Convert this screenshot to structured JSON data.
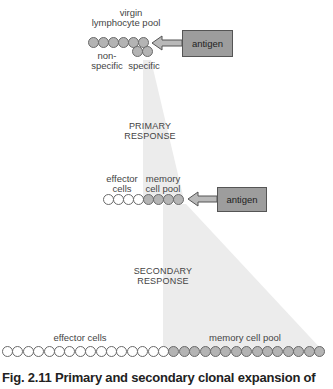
{
  "figure": {
    "caption": "Fig. 2.11  Primary and secondary clonal expansion of",
    "colors": {
      "cell_gray": "#b4b4b4",
      "cell_white": "#ffffff",
      "antigen_box": "#9d9d9d",
      "cone_shade": "#ececec"
    }
  },
  "stage1": {
    "pool_label_line1": "virgin",
    "pool_label_line2": "lymphocyte pool",
    "nonspecific_label_line1": "non-",
    "nonspecific_label_line2": "specific",
    "specific_label": "specific",
    "antigen_label": "antigen",
    "row_cells": 6,
    "specific_cells_below": 2
  },
  "primary_response": {
    "line1": "PRIMARY",
    "line2": "RESPONSE"
  },
  "stage2": {
    "effector_label_line1": "effector",
    "effector_label_line2": "cells",
    "memory_label_line1": "memory",
    "memory_label_line2": "cell pool",
    "antigen_label": "antigen",
    "effector_cells": 4,
    "memory_cells": 4
  },
  "secondary_response": {
    "line1": "SECONDARY",
    "line2": "RESPONSE"
  },
  "stage3": {
    "effector_label": "effector cells",
    "memory_label": "memory cell pool",
    "effector_cells": 16,
    "memory_cells": 15
  }
}
